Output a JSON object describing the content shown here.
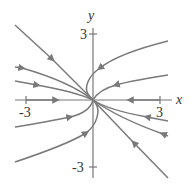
{
  "diagram": {
    "type": "phase-portrait",
    "axes": {
      "x_label": "x",
      "y_label": "y",
      "x_ticks": [
        "-3",
        "3"
      ],
      "y_ticks": [
        "3",
        "-3"
      ],
      "x_range": [
        -3.5,
        3.5
      ],
      "y_range": [
        -3.5,
        3.5
      ]
    },
    "colors": {
      "trajectory": "#7a7a7a",
      "axis": "#777777",
      "text": "#333333"
    },
    "trajectories": [
      {
        "name": "straight-line-eigenvector",
        "direction": "toward-origin"
      },
      {
        "name": "upper-right-hook",
        "direction": "toward-origin"
      },
      {
        "name": "right-upper",
        "direction": "toward-origin"
      },
      {
        "name": "left-upper-1",
        "direction": "toward-origin"
      },
      {
        "name": "left-upper-2",
        "direction": "toward-origin"
      },
      {
        "name": "x-axis-left",
        "direction": "toward-origin"
      },
      {
        "name": "x-axis-right",
        "direction": "toward-origin"
      },
      {
        "name": "right-lower-1",
        "direction": "toward-origin"
      },
      {
        "name": "right-lower-2",
        "direction": "toward-origin"
      },
      {
        "name": "left-lower-1",
        "direction": "toward-origin"
      },
      {
        "name": "left-lower-hook",
        "direction": "toward-origin"
      }
    ]
  }
}
